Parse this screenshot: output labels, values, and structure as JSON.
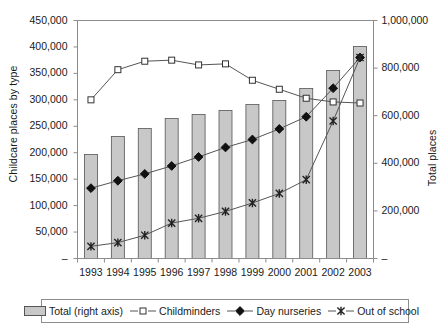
{
  "chart_data": {
    "type": "bar",
    "title": "",
    "subtitle": "",
    "xlabel": "",
    "ylabel": "Childcare places by type",
    "y2label": "Total places",
    "categories": [
      "1993",
      "1994",
      "1995",
      "1996",
      "1997",
      "1998",
      "1999",
      "2000",
      "2001",
      "2002",
      "2003"
    ],
    "ylim": [
      0,
      450000
    ],
    "y2lim": [
      0,
      1000000
    ],
    "yticks": [
      "–",
      "50,000",
      "100,000",
      "150,000",
      "200,000",
      "250,000",
      "300,000",
      "350,000",
      "400,000",
      "450,000"
    ],
    "ytick_values": [
      0,
      50000,
      100000,
      150000,
      200000,
      250000,
      300000,
      350000,
      400000,
      450000
    ],
    "y2ticks": [
      "–",
      "200,000",
      "400,000",
      "600,000",
      "800,000",
      "1,000,000"
    ],
    "y2tick_values": [
      0,
      200000,
      400000,
      600000,
      800000,
      1000000
    ],
    "grid": false,
    "legend_position": "bottom",
    "series": [
      {
        "name": "Total (right axis)",
        "type": "bar",
        "axis": "right",
        "marker": "square-filled",
        "color": "#c8c8c8",
        "values": [
          437000,
          513000,
          546000,
          588000,
          605000,
          622000,
          647000,
          664000,
          714000,
          790000,
          891000
        ]
      },
      {
        "name": "Childminders",
        "type": "line",
        "axis": "left",
        "marker": "open-square",
        "color": "#4d4d4d",
        "values": [
          300000,
          357000,
          373000,
          375000,
          366000,
          368000,
          337000,
          320000,
          303000,
          296000,
          294000
        ]
      },
      {
        "name": "Day nurseries",
        "type": "line",
        "axis": "left",
        "marker": "filled-diamond",
        "color": "#1a1a1a",
        "values": [
          133000,
          147000,
          160000,
          175000,
          192000,
          210000,
          225000,
          245000,
          268000,
          322000,
          380000
        ]
      },
      {
        "name": "Out of school",
        "type": "line",
        "axis": "left",
        "marker": "asterisk",
        "color": "#4d4d4d",
        "values": [
          23000,
          30000,
          44000,
          67000,
          76000,
          89000,
          105000,
          123000,
          149000,
          260000,
          380000
        ]
      }
    ]
  },
  "axes": {
    "left_title": "Childcare places by type",
    "right_title": "Total places"
  },
  "legend": {
    "items": [
      {
        "label": "Total (right axis)",
        "marker": "bar-swatch"
      },
      {
        "label": "Childminders",
        "marker": "open-square"
      },
      {
        "label": "Day nurseries",
        "marker": "filled-diamond"
      },
      {
        "label": "Out of school",
        "marker": "asterisk"
      }
    ]
  },
  "colors": {
    "bar_fill": "#c8c8c8",
    "bar_stroke": "#555555",
    "line": "#4d4d4d",
    "axis": "#8c8c8c",
    "text": "#1a1a1a"
  }
}
